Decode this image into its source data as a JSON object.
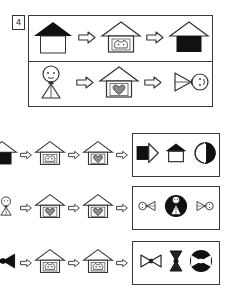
{
  "item": {
    "number": "4",
    "type": "visual-analogy-puzzle"
  },
  "icons": {
    "arrow": "arrow-right-outline-icon",
    "house_black_roof": "house-black-roof-icon",
    "house_cat": "house-with-cat-face-icon",
    "house_heart": "house-with-heart-icon",
    "house_black_body": "house-black-body-icon",
    "person": "stick-person-icon",
    "person_sideways": "stick-person-rotated-icon",
    "bowtie": "bowtie-icon",
    "circle_half": "circle-half-filled-icon",
    "circle_person": "circle-with-person-icon",
    "circle_bowtie": "circle-with-bowtie-icon",
    "house_plain": "house-outline-black-roof-icon",
    "house_rotated_black": "house-rotated-black-icon"
  },
  "examples": [
    {
      "id": "example-1",
      "label": "Example row 1",
      "sequence": [
        "house_black_roof",
        "arrow",
        "house_cat",
        "arrow",
        "house_black_body"
      ]
    },
    {
      "id": "example-2",
      "label": "Example row 2",
      "sequence": [
        "person",
        "arrow",
        "house_heart",
        "arrow",
        "person_sideways"
      ]
    }
  ],
  "questions": [
    {
      "id": "question-1",
      "label": "Question row 1",
      "sequence": [
        "house_black_body",
        "arrow",
        "house_cat",
        "arrow",
        "house_heart",
        "arrow"
      ],
      "answer": [
        "house_rotated_black",
        "house_plain",
        "circle_half"
      ]
    },
    {
      "id": "question-2",
      "label": "Question row 2",
      "sequence": [
        "person",
        "arrow",
        "house_heart",
        "arrow",
        "house_heart",
        "arrow"
      ],
      "answer": [
        "person_sideways_small",
        "circle_person",
        "person_sideways_small_flip"
      ]
    },
    {
      "id": "question-3",
      "label": "Question row 3",
      "sequence": [
        "bowtie",
        "arrow",
        "house_cat",
        "arrow",
        "house_cat",
        "arrow"
      ],
      "answer": [
        "bowtie_small",
        "bowtie_vertical",
        "circle_bowtie"
      ]
    }
  ],
  "colors": {
    "ink": "#1a1a1a",
    "border": "#3a3a3a",
    "fill_black": "#111111",
    "fill_gray": "#8a8a8a",
    "paper": "#ffffff"
  }
}
